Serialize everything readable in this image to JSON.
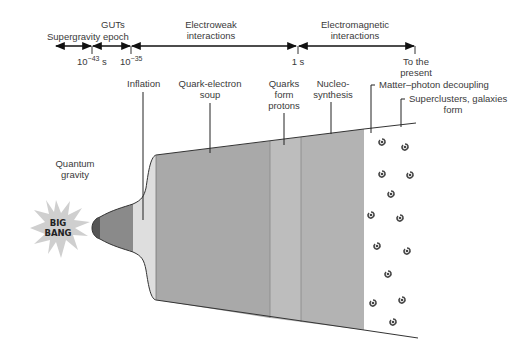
{
  "timeline": {
    "eras": [
      {
        "label": "Supergravity epoch"
      },
      {
        "label": "GUTs"
      },
      {
        "label_line1": "Electroweak",
        "label_line2": "interactions"
      },
      {
        "label_line1": "Electromagnetic",
        "label_line2": "interactions"
      }
    ],
    "ticks": [
      {
        "base": "10",
        "exp": "−43",
        "unit": " s"
      },
      {
        "base": "10",
        "exp": "−35",
        "unit": ""
      },
      {
        "label": "1 s"
      },
      {
        "label_line1": "To the",
        "label_line2": "present"
      }
    ]
  },
  "stages": {
    "quantum_gravity": {
      "line1": "Quantum",
      "line2": "gravity"
    },
    "big_bang": {
      "line1": "BIG",
      "line2": "BANG"
    },
    "inflation": {
      "label": "Inflation"
    },
    "quark_soup": {
      "line1": "Quark-electron",
      "line2": "soup"
    },
    "quarks_protons": {
      "line1": "Quarks",
      "line2": "form",
      "line3": "protons"
    },
    "nucleosynthesis": {
      "line1": "Nucleo-",
      "line2": "synthesis"
    },
    "decoupling": {
      "label": "Matter–photon decoupling"
    },
    "galaxies": {
      "line1": "Superclusters, galaxies",
      "line2": "form"
    }
  },
  "colors": {
    "quantum": "#555555",
    "gut": "#8a8a8a",
    "inflation": "#dedede",
    "soup": "#a9a9a9",
    "protons": "#bdbdbd",
    "nucleo": "#b3b3b3",
    "galaxy": "#444444",
    "starburst": "#cfcfcf"
  }
}
